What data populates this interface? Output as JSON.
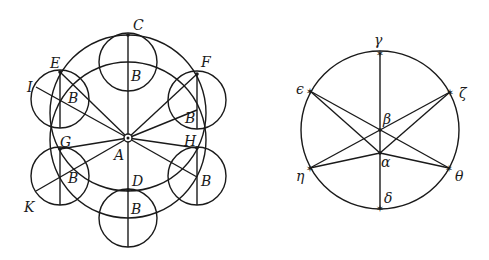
{
  "figure_left": {
    "labels": {
      "C": "C",
      "E": "E",
      "F": "F",
      "I": "I",
      "G": "G",
      "H": "H",
      "A": "A",
      "D": "D",
      "K": "K",
      "B": "B"
    }
  },
  "figure_right": {
    "labels": {
      "gamma": "γ",
      "epsilon": "ϵ",
      "zeta": "ζ",
      "beta": "β",
      "alpha": "α",
      "eta": "η",
      "theta": "θ",
      "delta": "δ"
    }
  }
}
